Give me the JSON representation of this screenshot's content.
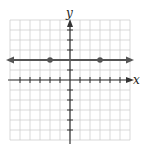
{
  "chart_data": {
    "type": "line",
    "title": "",
    "xlabel": "x",
    "ylabel": "y",
    "xlim": [
      -6,
      6
    ],
    "ylim": [
      -6,
      6
    ],
    "grid": true,
    "tick_spacing": 1,
    "series": [
      {
        "name": "horizontal line y = 2",
        "equation": "y = 2",
        "x": [
          -6,
          6
        ],
        "y": [
          2,
          2
        ],
        "arrows_both_ends": true
      }
    ],
    "points": [
      {
        "x": -2,
        "y": 2
      },
      {
        "x": 3,
        "y": 2
      }
    ]
  },
  "labels": {
    "x_axis": "x",
    "y_axis": "y"
  },
  "colors": {
    "grid": "#cfcfcf",
    "axis": "#333333",
    "line": "#555555",
    "point": "#555555"
  }
}
